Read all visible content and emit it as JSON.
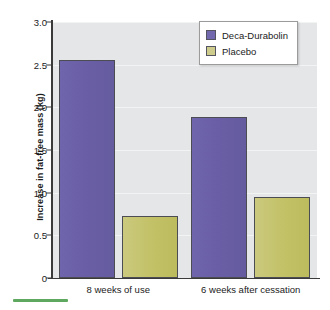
{
  "chart_data": {
    "type": "bar",
    "title": "",
    "subtitle": "",
    "xlabel": "",
    "ylabel": "Increase in fat-free mass (kg)",
    "categories": [
      "8 weeks of use",
      "6 weeks after cessation"
    ],
    "series": [
      {
        "name": "Deca-Durabolin",
        "color": "#6a5fa6",
        "values": [
          2.55,
          1.89
        ]
      },
      {
        "name": "Placebo",
        "color": "#c3c268",
        "values": [
          0.73,
          0.95
        ]
      }
    ],
    "ylim": [
      0,
      3.0
    ],
    "yticks": [
      "0",
      "0.5",
      "1.0",
      "1.5",
      "2.0",
      "2.5",
      "3.0"
    ],
    "ytick_values": [
      0,
      0.5,
      1.0,
      1.5,
      2.0,
      2.5,
      3.0
    ],
    "grid": true,
    "grid_axis": "y",
    "legend_position": "top-right",
    "plot_background": "#e4e6e7",
    "figure_background": "#ffffff"
  },
  "legend": {
    "items": [
      {
        "label": "Deca-Durabolin",
        "swatch": "deca"
      },
      {
        "label": "Placebo",
        "swatch": "placebo"
      }
    ]
  },
  "accent": {
    "color": "#5fa85f"
  }
}
